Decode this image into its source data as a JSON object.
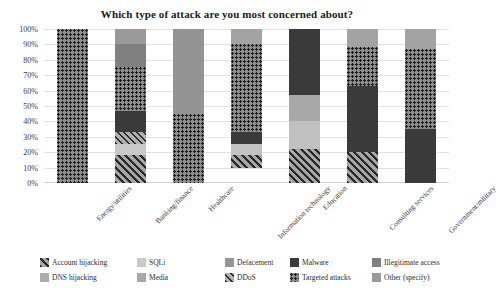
{
  "chart_data": {
    "type": "bar",
    "subtype": "stacked-percent-100",
    "title": "Which type of attack are you most concerned about?",
    "xlabel": "",
    "ylabel": "",
    "ylim": [
      0,
      100
    ],
    "ytick_labels": [
      "100%",
      "90%",
      "80%",
      "70%",
      "60%",
      "50%",
      "40%",
      "30%",
      "20%",
      "10%",
      "0%"
    ],
    "ytick_values": [
      100,
      90,
      80,
      70,
      60,
      50,
      40,
      30,
      20,
      10,
      0
    ],
    "grid": true,
    "legend_position": "bottom",
    "categories": [
      "Energy/utilities",
      "Banking/finance",
      "Healthcare",
      "Information technology",
      "Education",
      "Consulting services",
      "Government/military"
    ],
    "series": [
      {
        "name": "Account hijacking",
        "key": "account_hijacking",
        "color": "#a0a0a0",
        "pattern": "diagonal-dense",
        "values": [
          0,
          18,
          0,
          8,
          22,
          20,
          0
        ]
      },
      {
        "name": "DNS hijacking",
        "key": "dns_hijacking",
        "color": "#adadad",
        "pattern": "solid",
        "values": [
          0,
          0,
          0,
          0,
          0,
          0,
          0
        ]
      },
      {
        "name": "SQLi",
        "key": "sqli",
        "color": "#c9c9c9",
        "pattern": "solid",
        "values": [
          0,
          7,
          0,
          7,
          18,
          0,
          0
        ]
      },
      {
        "name": "Media",
        "key": "media",
        "color": "#8f8f8f",
        "pattern": "solid",
        "values": [
          0,
          0,
          0,
          0,
          17,
          0,
          0
        ]
      },
      {
        "name": "Defacement",
        "key": "defacement",
        "color": "#949494",
        "pattern": "solid",
        "values": [
          0,
          10,
          55,
          10,
          0,
          12,
          13
        ]
      },
      {
        "name": "DDoS",
        "key": "ddos",
        "color": "#b4b4b4",
        "pattern": "diagonal",
        "values": [
          0,
          8,
          0,
          0,
          0,
          0,
          0
        ]
      },
      {
        "name": "Malware",
        "key": "malware",
        "color": "#3a3a3a",
        "pattern": "solid",
        "values": [
          0,
          14,
          0,
          8,
          43,
          43,
          35
        ]
      },
      {
        "name": "Targeted attacks",
        "key": "targeted_attacks",
        "color": "#8c8c8c",
        "pattern": "dots",
        "values": [
          100,
          28,
          45,
          57,
          0,
          25,
          52
        ]
      },
      {
        "name": "Illegitimate access",
        "key": "illegitimate_access",
        "color": "#7d7d7d",
        "pattern": "solid",
        "values": [
          0,
          15,
          0,
          10,
          0,
          0,
          0
        ]
      },
      {
        "name": "Other (specify)",
        "key": "other_specify",
        "color": "#9a9a9a",
        "pattern": "solid",
        "values": [
          0,
          0,
          0,
          0,
          0,
          0,
          0
        ]
      }
    ],
    "stacks": [
      {
        "category": "Energy/utilities",
        "segments": [
          {
            "series": "Targeted attacks",
            "value": 100,
            "color": "#8c8c8c",
            "pattern": "dots"
          }
        ]
      },
      {
        "category": "Banking/finance",
        "segments": [
          {
            "series": "Defacement",
            "value": 10,
            "color": "#9a9a9a",
            "pattern": "solid"
          },
          {
            "series": "Illegitimate access",
            "value": 15,
            "color": "#808080",
            "pattern": "solid"
          },
          {
            "series": "Targeted attacks",
            "value": 28,
            "color": "#8c8c8c",
            "pattern": "dots"
          },
          {
            "series": "Malware",
            "value": 14,
            "color": "#3a3a3a",
            "pattern": "solid"
          },
          {
            "series": "DDoS",
            "value": 8,
            "color": "#b0b0b0",
            "pattern": "diagonal"
          },
          {
            "series": "SQLi",
            "value": 7,
            "color": "#c9c9c9",
            "pattern": "solid"
          },
          {
            "series": "Account hijacking",
            "value": 18,
            "color": "#a6a6a6",
            "pattern": "diagonal-dense"
          }
        ]
      },
      {
        "category": "Healthcare",
        "segments": [
          {
            "series": "Defacement",
            "value": 55,
            "color": "#949494",
            "pattern": "solid"
          },
          {
            "series": "Targeted attacks",
            "value": 45,
            "color": "#8c8c8c",
            "pattern": "dots"
          }
        ]
      },
      {
        "category": "Information technology",
        "segments": [
          {
            "series": "Defacement",
            "value": 10,
            "color": "#a3a3a3",
            "pattern": "solid"
          },
          {
            "series": "Targeted attacks",
            "value": 57,
            "color": "#8c8c8c",
            "pattern": "dots"
          },
          {
            "series": "Malware",
            "value": 8,
            "color": "#3a3a3a",
            "pattern": "solid"
          },
          {
            "series": "SQLi",
            "value": 7,
            "color": "#c2c2c2",
            "pattern": "solid"
          },
          {
            "series": "Account hijacking",
            "value": 8,
            "color": "#a6a6a6",
            "pattern": "diagonal-dense"
          }
        ]
      },
      {
        "category": "Education",
        "segments": [
          {
            "series": "Malware",
            "value": 43,
            "color": "#3a3a3a",
            "pattern": "solid"
          },
          {
            "series": "Media",
            "value": 17,
            "color": "#a8a8a8",
            "pattern": "solid"
          },
          {
            "series": "SQLi",
            "value": 18,
            "color": "#c0c0c0",
            "pattern": "solid"
          },
          {
            "series": "Account hijacking",
            "value": 22,
            "color": "#a6a6a6",
            "pattern": "diagonal-dense"
          }
        ]
      },
      {
        "category": "Consulting services",
        "segments": [
          {
            "series": "Defacement",
            "value": 12,
            "color": "#a3a3a3",
            "pattern": "solid"
          },
          {
            "series": "Targeted attacks",
            "value": 25,
            "color": "#8c8c8c",
            "pattern": "dots"
          },
          {
            "series": "Malware",
            "value": 43,
            "color": "#3a3a3a",
            "pattern": "solid"
          },
          {
            "series": "Account hijacking",
            "value": 20,
            "color": "#a6a6a6",
            "pattern": "diagonal-dense"
          }
        ]
      },
      {
        "category": "Government/military",
        "segments": [
          {
            "series": "Defacement",
            "value": 13,
            "color": "#a3a3a3",
            "pattern": "solid"
          },
          {
            "series": "Targeted attacks",
            "value": 52,
            "color": "#8c8c8c",
            "pattern": "dots"
          },
          {
            "series": "Malware",
            "value": 35,
            "color": "#3a3a3a",
            "pattern": "solid"
          }
        ]
      }
    ],
    "legend": [
      {
        "label": "Account hijacking",
        "color": "#a6a6a6",
        "pattern": "diagonal-dense"
      },
      {
        "label": "DNS hijacking",
        "color": "#adadad",
        "pattern": "solid"
      },
      {
        "label": "SQLi",
        "color": "#c9c9c9",
        "pattern": "solid"
      },
      {
        "label": "Media",
        "color": "#a8a8a8",
        "pattern": "solid"
      },
      {
        "label": "Defacement",
        "color": "#949494",
        "pattern": "solid"
      },
      {
        "label": "DDoS",
        "color": "#b0b0b0",
        "pattern": "diagonal"
      },
      {
        "label": "Malware",
        "color": "#3a3a3a",
        "pattern": "solid"
      },
      {
        "label": "Targeted attacks",
        "color": "#8c8c8c",
        "pattern": "dots"
      },
      {
        "label": "Illegitimate access",
        "color": "#808080",
        "pattern": "solid"
      },
      {
        "label": "Other (specify)",
        "color": "#9a9a9a",
        "pattern": "solid"
      }
    ]
  }
}
